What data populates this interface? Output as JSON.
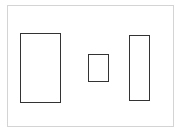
{
  "canvas": {
    "width": 185,
    "height": 132,
    "background": "#ffffff",
    "frame": {
      "x": 7,
      "y": 5,
      "w": 167,
      "h": 122,
      "border_color": "#d4d4d4"
    },
    "shapes": [
      {
        "type": "rectangle",
        "x": 20,
        "y": 33,
        "w": 41,
        "h": 70,
        "stroke": "#333333"
      },
      {
        "type": "rectangle",
        "x": 88,
        "y": 54,
        "w": 21,
        "h": 28,
        "stroke": "#333333"
      },
      {
        "type": "rectangle",
        "x": 129,
        "y": 35,
        "w": 21,
        "h": 66,
        "stroke": "#333333"
      }
    ]
  }
}
